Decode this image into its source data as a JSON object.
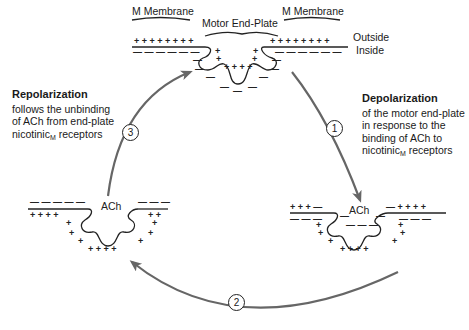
{
  "top_state": {
    "labels": {
      "membrane_left": "M Membrane",
      "end_plate": "Motor End-Plate",
      "membrane_right": "M Membrane",
      "outside": "Outside",
      "inside": "Inside"
    },
    "polarity": "resting: + outside, - inside"
  },
  "left_state": {
    "label": "ACh",
    "polarity": "repolarizing"
  },
  "right_state": {
    "label": "ACh",
    "polarity": "depolarized: - outside at end-plate, + inside"
  },
  "steps": [
    {
      "number": "1",
      "title": "Depolarization",
      "lines": [
        "of the motor end-plate",
        "in response to the",
        "binding of ACh to",
        "nicotinic"
      ],
      "subscript": "M",
      "tail": " receptors"
    },
    {
      "number": "2"
    },
    {
      "number": "3",
      "title": "Repolarization",
      "lines": [
        "follows the unbinding",
        "of ACh from end-plate",
        "nicotinic"
      ],
      "subscript": "M",
      "tail": " receptors"
    }
  ],
  "colors": {
    "arrow": "#666666",
    "ink": "#222222",
    "background": "#ffffff"
  }
}
